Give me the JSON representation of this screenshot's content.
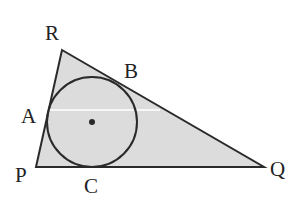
{
  "diagram": {
    "type": "geometry",
    "colors": {
      "fill": "#dcdcdc",
      "stroke": "#2a2a2a",
      "background": "#ffffff"
    },
    "vertices": {
      "R": {
        "label": "R",
        "x": 62,
        "y": 50
      },
      "P": {
        "label": "P",
        "x": 36,
        "y": 167
      },
      "Q": {
        "label": "Q",
        "x": 264,
        "y": 167
      }
    },
    "tangent_points": {
      "A": {
        "label": "A"
      },
      "B": {
        "label": "B"
      },
      "C": {
        "label": "C"
      }
    },
    "incircle": {
      "cx": 92,
      "cy": 122,
      "r": 45
    },
    "labels": {
      "R": "R",
      "B": "B",
      "A": "A",
      "P": "P",
      "C": "C",
      "Q": "Q"
    }
  }
}
